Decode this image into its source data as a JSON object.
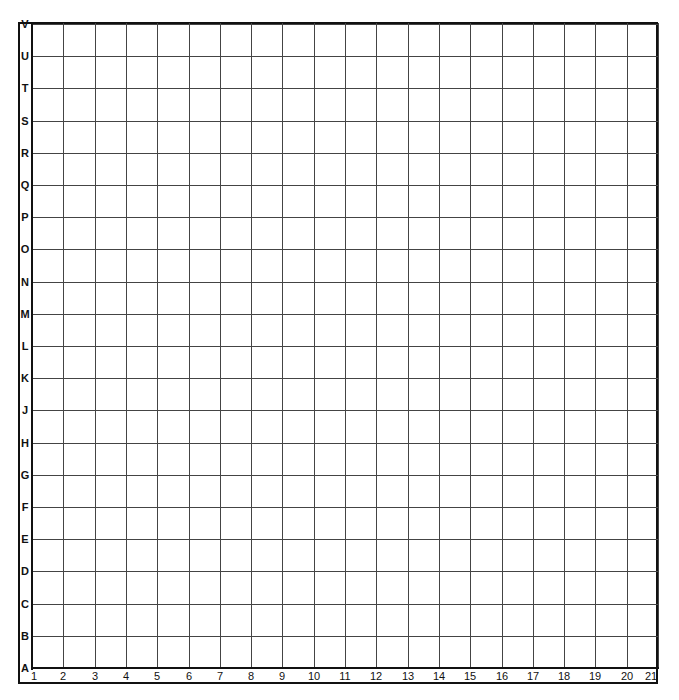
{
  "grid": {
    "row_labels": [
      "V",
      "U",
      "T",
      "S",
      "R",
      "Q",
      "P",
      "O",
      "N",
      "M",
      "L",
      "K",
      "J",
      "H",
      "G",
      "F",
      "E",
      "D",
      "C",
      "B",
      "A"
    ],
    "column_labels": [
      "1",
      "2",
      "3",
      "4",
      "5",
      "6",
      "7",
      "8",
      "9",
      "10",
      "11",
      "12",
      "13",
      "14",
      "15",
      "16",
      "17",
      "18",
      "19",
      "20",
      "21"
    ],
    "rows": 21,
    "columns": 21,
    "line_color": "#444444",
    "frame_color": "#111111",
    "background": "#ffffff"
  }
}
